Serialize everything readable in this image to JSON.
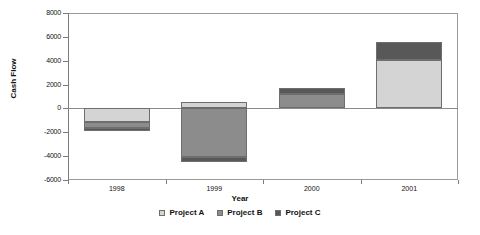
{
  "chart_data": {
    "type": "bar",
    "stacked": true,
    "orientation": "vertical",
    "title": "",
    "xlabel": "Year",
    "ylabel": "Cash Flow",
    "categories": [
      "1998",
      "1999",
      "2000",
      "2001"
    ],
    "ylim": [
      -6000,
      8000
    ],
    "ytick_step": 2000,
    "yticks": [
      "8000",
      "6000",
      "4000",
      "2000",
      "0",
      "-2000",
      "-4000",
      "-6000"
    ],
    "ytick_values": [
      8000,
      6000,
      4000,
      2000,
      0,
      -2000,
      -4000,
      -6000
    ],
    "grid": false,
    "legend_position": "bottom",
    "series": [
      {
        "name": "Project A",
        "color": "#d4d4d4",
        "values": [
          -1100,
          550,
          0,
          4050
        ]
      },
      {
        "name": "Project B",
        "color": "#8c8c8c",
        "values": [
          -550,
          -4100,
          1200,
          0
        ]
      },
      {
        "name": "Project C",
        "color": "#585858",
        "values": [
          -250,
          -350,
          550,
          1550
        ]
      }
    ],
    "stack_segments": [
      {
        "category": "1998",
        "segments": [
          {
            "series": "Project A",
            "from": 0,
            "to": -1100,
            "color": "#d4d4d4"
          },
          {
            "series": "Project B",
            "from": -1100,
            "to": -1650,
            "color": "#8c8c8c"
          },
          {
            "series": "Project C",
            "from": -1650,
            "to": -1900,
            "color": "#585858"
          }
        ]
      },
      {
        "category": "1999",
        "segments": [
          {
            "series": "Project A",
            "from": 0,
            "to": 550,
            "color": "#d4d4d4"
          },
          {
            "series": "Project B",
            "from": 0,
            "to": -4100,
            "color": "#8c8c8c"
          },
          {
            "series": "Project C",
            "from": -4100,
            "to": -4450,
            "color": "#585858"
          }
        ]
      },
      {
        "category": "2000",
        "segments": [
          {
            "series": "Project B",
            "from": 0,
            "to": 1200,
            "color": "#8c8c8c"
          },
          {
            "series": "Project C",
            "from": 1200,
            "to": 1750,
            "color": "#585858"
          }
        ]
      },
      {
        "category": "2001",
        "segments": [
          {
            "series": "Project A",
            "from": 0,
            "to": 4050,
            "color": "#d4d4d4"
          },
          {
            "series": "Project C",
            "from": 4050,
            "to": 5600,
            "color": "#585858"
          }
        ]
      }
    ]
  },
  "axis": {
    "y_title": "Cash Flow",
    "x_title": "Year"
  },
  "legend": {
    "items": [
      {
        "label": "Project A",
        "color": "#d4d4d4"
      },
      {
        "label": "Project B",
        "color": "#8c8c8c"
      },
      {
        "label": "Project C",
        "color": "#585858"
      }
    ]
  }
}
